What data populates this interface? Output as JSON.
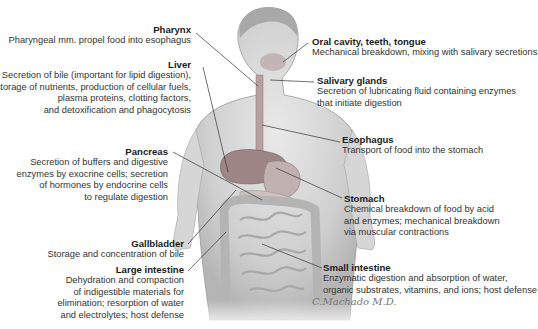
{
  "diagram": {
    "labels": [
      {
        "id": "pharynx",
        "title": "Pharynx",
        "lines": [
          "Pharyngeal mm. propel food into esophagus"
        ]
      },
      {
        "id": "liver",
        "title": "Liver",
        "lines": [
          "Secretion of bile (important for lipid digestion),",
          "storage of nutrients, production of cellular fuels,",
          "plasma proteins, clotting factors,",
          "and detoxification and phagocytosis"
        ]
      },
      {
        "id": "pancreas",
        "title": "Pancreas",
        "lines": [
          "Secretion of buffers and digestive",
          "enzymes by exocrine cells; secretion",
          "of hormones by endocrine cells",
          "to regulate digestion"
        ]
      },
      {
        "id": "gallbladder",
        "title": "Gallbladder",
        "lines": [
          "Storage and concentration of bile"
        ]
      },
      {
        "id": "large-intestine",
        "title": "Large intestine",
        "lines": [
          "Dehydration and compaction",
          "of indigestible materials for",
          "elimination; resorption of water",
          "and electrolytes; host defense"
        ]
      },
      {
        "id": "oral-cavity",
        "title": "Oral cavity, teeth, tongue",
        "lines": [
          "Mechanical breakdown, mixing with salivary secretions"
        ]
      },
      {
        "id": "salivary-glands",
        "title": "Salivary glands",
        "lines": [
          "Secretion of lubricating fluid containing enzymes",
          "that initiate digestion"
        ]
      },
      {
        "id": "esophagus",
        "title": "Esophagus",
        "lines": [
          "Transport of food into the stomach"
        ]
      },
      {
        "id": "stomach",
        "title": "Stomach",
        "lines": [
          "Chemical breakdown of food by acid",
          "and enzymes; mechanical breakdown",
          "via muscular contractions"
        ]
      },
      {
        "id": "small-intestine",
        "title": "Small intestine",
        "lines": [
          "Enzymatic digestion and absorption of water,",
          "organic substrates, vitamins, and ions; host defense"
        ]
      }
    ],
    "signature": "C.Machado M.D."
  }
}
